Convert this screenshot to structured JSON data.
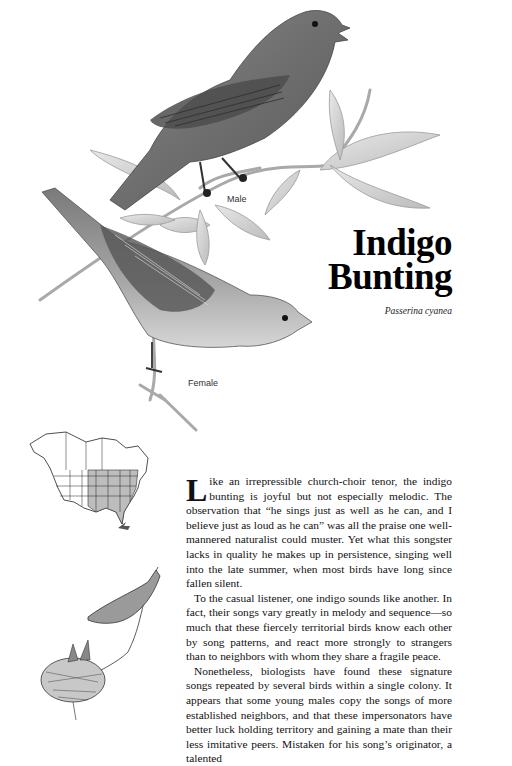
{
  "header": {
    "title_line1": "Indigo",
    "title_line2": "Bunting",
    "scientific_name": "Passerina cyanea"
  },
  "illustrations": {
    "male_caption": "Male",
    "female_caption": "Female",
    "range_map": "range-map-north-america",
    "nest_scene": "female-feeding-nestlings"
  },
  "article": {
    "drop_cap": "L",
    "paragraphs": [
      "ike an irrepressible church-choir tenor, the indigo bunting is joyful but not especially melodic. The observation that “he sings just as well as he can, and I believe just as loud as he can” was all the praise one well-mannered naturalist could muster. Yet what this songster lacks in quality he makes up in persistence, singing well into the late summer, when most birds have long since fallen silent.",
      "To the casual listener, one indigo sounds like another. In fact, their songs vary greatly in melody and sequence—so much that these fiercely territorial birds know each other by song patterns, and react more strongly to strangers than to neighbors with whom they share a fragile peace.",
      "Nonetheless, biologists have found these signature songs repeated by several birds within a single colony. It appears that some young males copy the songs of more established neighbors, and that these impersonators have better luck holding territory and gaining a mate than their less imitative peers. Mistaken for his song’s originator, a talented"
    ]
  },
  "colors": {
    "background": "#ffffff",
    "text": "#111111",
    "range_fill": "#bdbdbd"
  }
}
